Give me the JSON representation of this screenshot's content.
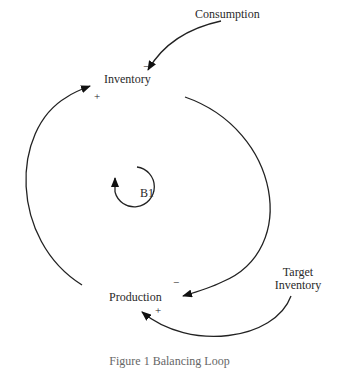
{
  "diagram": {
    "type": "causal-loop",
    "nodes": {
      "consumption": "Consumption",
      "inventory": "Inventory",
      "production": "Production",
      "target_inventory_line1": "Target",
      "target_inventory_line2": "Inventory"
    },
    "loop_label": "B1",
    "links": [
      {
        "from": "Consumption",
        "to": "Inventory",
        "polarity": "-"
      },
      {
        "from": "Inventory",
        "to": "Production",
        "polarity": "-"
      },
      {
        "from": "Production",
        "to": "Inventory",
        "polarity": "+"
      },
      {
        "from": "Target Inventory",
        "to": "Production",
        "polarity": "+"
      }
    ],
    "signs": {
      "consumption_inventory": "−",
      "inventory_production": "−",
      "production_inventory": "+",
      "target_production": "+"
    },
    "caption": "Figure 1 Balancing Loop"
  }
}
